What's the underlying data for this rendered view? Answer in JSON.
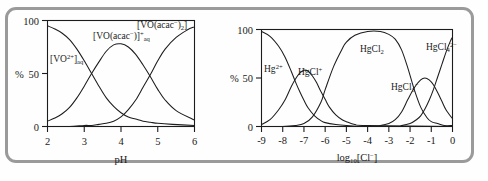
{
  "figure": {
    "border_color": "#9a9a9a",
    "background": "#ffffff"
  },
  "chart_data": [
    {
      "type": "line",
      "id": "vanadium-acac-speciation",
      "title": "",
      "xlabel": "pH",
      "ylabel": "%",
      "xlim": [
        2,
        6
      ],
      "ylim": [
        0,
        100
      ],
      "xticks": [
        2,
        3,
        4,
        5,
        6
      ],
      "xtick_labels": [
        "2",
        "3",
        "4",
        "5",
        "6"
      ],
      "yticks": [
        0,
        50,
        100
      ],
      "ytick_labels": [
        "0",
        "50",
        "100"
      ],
      "grid": false,
      "legend": "inline-annotations",
      "annotations": [
        {
          "id": "vo2plus",
          "text": "[VO",
          "sup": "2+",
          "tail": "]",
          "sub": "aq",
          "x": 2.45,
          "y": 62
        },
        {
          "id": "vo-acac-plus",
          "text": "[VO(acac",
          "sup": "−",
          "tail": ")]",
          "sup2": "+",
          "sub": "aq",
          "x": 3.45,
          "y": 86
        },
        {
          "id": "vo-acac-2",
          "text": "[VO(acac",
          "sup": "−",
          "tail": ")",
          "sub": "2",
          "tail2": "]",
          "x": 4.95,
          "y": 97
        }
      ],
      "series": [
        {
          "name": "[VO2+]aq",
          "x": [
            2.0,
            2.2,
            2.4,
            2.6,
            2.8,
            3.0,
            3.2,
            3.4,
            3.6,
            3.8,
            4.0,
            4.2,
            4.4,
            4.6,
            4.8,
            5.0,
            5.4,
            6.0
          ],
          "values": [
            95,
            92,
            88,
            82,
            73,
            62,
            50,
            38,
            27,
            19,
            13,
            9,
            7,
            5,
            4,
            3,
            2,
            1
          ]
        },
        {
          "name": "[VO(acac)]+aq",
          "x": [
            2.0,
            2.2,
            2.4,
            2.6,
            2.8,
            3.0,
            3.2,
            3.4,
            3.6,
            3.8,
            4.0,
            4.2,
            4.4,
            4.6,
            4.8,
            5.0,
            5.2,
            5.5,
            6.0
          ],
          "values": [
            5,
            8,
            12,
            18,
            27,
            38,
            50,
            61,
            71,
            77,
            78,
            75,
            68,
            58,
            47,
            35,
            25,
            15,
            6
          ]
        },
        {
          "name": "[VO(acac)2]",
          "x": [
            2.0,
            2.6,
            3.0,
            3.2,
            3.4,
            3.6,
            3.8,
            4.0,
            4.2,
            4.4,
            4.6,
            4.8,
            5.0,
            5.2,
            5.5,
            5.8,
            6.0
          ],
          "values": [
            0,
            0,
            1,
            1,
            2,
            3,
            5,
            9,
            16,
            25,
            37,
            49,
            62,
            73,
            84,
            91,
            94
          ]
        }
      ]
    },
    {
      "type": "line",
      "id": "mercury-chloride-speciation",
      "title": "",
      "xlabel": "log10[Cl-]",
      "xlabel_base": "log",
      "xlabel_sub": "10",
      "xlabel_rest": "[Cl",
      "xlabel_sup": "−",
      "xlabel_close": "]",
      "ylabel": "%",
      "xlim": [
        -9,
        0
      ],
      "ylim": [
        0,
        100
      ],
      "xticks": [
        -9,
        -8,
        -7,
        -6,
        -5,
        -4,
        -3,
        -2,
        -1,
        0
      ],
      "xtick_labels": [
        "-9",
        "-8",
        "-7",
        "-6",
        "-5",
        "-4",
        "-3",
        "-2",
        "-1",
        "0"
      ],
      "yticks": [
        0,
        50,
        100
      ],
      "ytick_labels": [
        "0",
        "50",
        "100"
      ],
      "grid": false,
      "legend": "inline-annotations",
      "annotations": [
        {
          "id": "hg2plus",
          "text": "Hg",
          "sup": "2+",
          "x": -8.55,
          "y": 63
        },
        {
          "id": "hgclplus",
          "text": "HgCl",
          "sup": "+",
          "x": -7.45,
          "y": 63
        },
        {
          "id": "hgcl2",
          "text": "HgCl",
          "sub": "2",
          "x": -4.6,
          "y": 88
        },
        {
          "id": "hgcl3minus",
          "text": "HgCl",
          "sub": "3",
          "sup": "−",
          "x": -2.25,
          "y": 50
        },
        {
          "id": "hgcl4-2minus",
          "text": "HgCl",
          "sub": "4",
          "sup": "2−",
          "x": -0.72,
          "y": 90
        }
      ],
      "series": [
        {
          "name": "Hg2+",
          "x": [
            -9.0,
            -8.6,
            -8.2,
            -7.9,
            -7.6,
            -7.4,
            -7.2,
            -7.0,
            -6.8,
            -6.5,
            -6.2,
            -6.0,
            -5.5,
            -5.0,
            -4.0,
            0.0
          ],
          "values": [
            98,
            93,
            83,
            72,
            57,
            46,
            36,
            27,
            19,
            11,
            6,
            4,
            2,
            1,
            0,
            0
          ]
        },
        {
          "name": "HgCl+",
          "x": [
            -9.0,
            -8.6,
            -8.2,
            -7.9,
            -7.6,
            -7.4,
            -7.2,
            -7.0,
            -6.8,
            -6.6,
            -6.4,
            -6.2,
            -6.0,
            -5.8,
            -5.5,
            -5.2,
            -5.0,
            -4.6,
            -4.0,
            0.0
          ],
          "values": [
            2,
            7,
            17,
            27,
            41,
            49,
            55,
            58,
            57,
            52,
            45,
            36,
            28,
            20,
            12,
            7,
            5,
            2,
            1,
            0
          ]
        },
        {
          "name": "HgCl2",
          "x": [
            -9.0,
            -8.0,
            -7.4,
            -7.0,
            -6.6,
            -6.2,
            -6.0,
            -5.6,
            -5.2,
            -5.0,
            -4.6,
            -4.0,
            -3.4,
            -3.0,
            -2.7,
            -2.4,
            -2.1,
            -1.8,
            -1.5,
            -1.2,
            -1.0,
            -0.7,
            -0.4,
            0.0
          ],
          "values": [
            0,
            0,
            1,
            3,
            10,
            25,
            38,
            62,
            80,
            87,
            94,
            98,
            98,
            95,
            90,
            79,
            60,
            38,
            20,
            9,
            5,
            3,
            1,
            1
          ]
        },
        {
          "name": "HgCl3-",
          "x": [
            -9.0,
            -4.0,
            -3.4,
            -3.0,
            -2.7,
            -2.4,
            -2.1,
            -1.8,
            -1.5,
            -1.3,
            -1.1,
            -0.9,
            -0.7,
            -0.5,
            -0.3,
            0.0
          ],
          "values": [
            0,
            0,
            1,
            3,
            7,
            15,
            28,
            40,
            48,
            50,
            48,
            43,
            35,
            26,
            17,
            8
          ]
        },
        {
          "name": "HgCl4 2-",
          "x": [
            -9.0,
            -3.0,
            -2.4,
            -2.0,
            -1.7,
            -1.5,
            -1.3,
            -1.1,
            -0.9,
            -0.7,
            -0.5,
            -0.3,
            -0.1,
            0.0
          ],
          "values": [
            0,
            0,
            1,
            3,
            7,
            11,
            18,
            27,
            38,
            51,
            64,
            77,
            88,
            92
          ]
        }
      ]
    }
  ]
}
